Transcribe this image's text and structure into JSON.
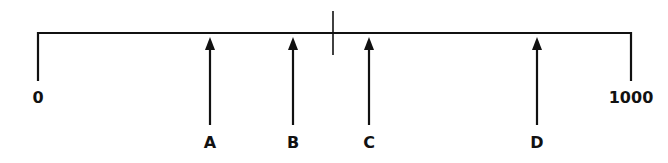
{
  "diagram": {
    "type": "number-line",
    "color": "#111111",
    "scale": {
      "min_label": "0",
      "max_label": "1000",
      "min_value": 0,
      "max_value": 1000,
      "x_start": 38,
      "x_end": 631,
      "line_y": 33
    },
    "midpoint_tick": {
      "x": 333,
      "y1": 11,
      "y2": 55
    },
    "arrows": [
      {
        "label": "A",
        "x": 210
      },
      {
        "label": "B",
        "x": 293
      },
      {
        "label": "C",
        "x": 369
      },
      {
        "label": "D",
        "x": 537
      }
    ]
  }
}
